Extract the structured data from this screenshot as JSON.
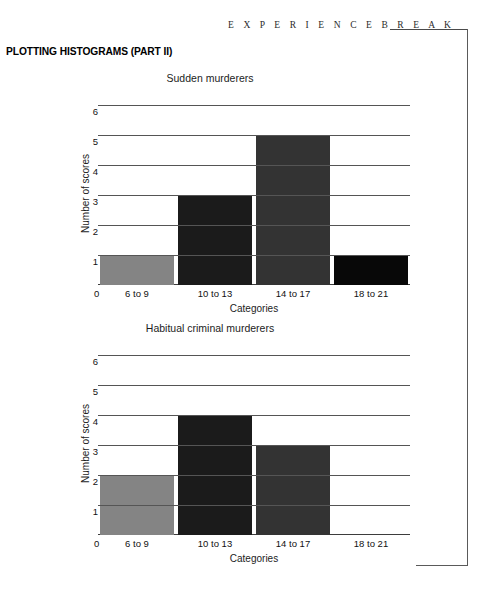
{
  "header": {
    "break_label": "E X P E R I E N C E   B R E A K",
    "section_heading": "PLOTTING HISTOGRAMS (PART II)"
  },
  "colors": {
    "bar_category_1": "#848484",
    "bar_category_2": "#1b1b1b",
    "bar_category_3": "#333333",
    "bar_category_4": "#080808",
    "gridline": "#555555",
    "axis": "#3d3d3d",
    "frame_rule": "#5a5a5a"
  },
  "charts": [
    {
      "id": "chart-1",
      "chart_data": {
        "type": "bar",
        "title": "Sudden murderers",
        "xlabel": "Categories",
        "ylabel": "Number of scores",
        "categories": [
          "6 to 9",
          "10 to 13",
          "14 to 17",
          "18 to 21"
        ],
        "values": [
          1,
          3,
          5,
          1
        ],
        "origin_label": "0",
        "ytick_labels": [
          "1",
          "2",
          "3",
          "4",
          "5",
          "6"
        ],
        "ylim": [
          0,
          6
        ],
        "grid": true,
        "legend": "none",
        "bar_colors": [
          "#848484",
          "#1b1b1b",
          "#333333",
          "#080808"
        ]
      }
    },
    {
      "id": "chart-2",
      "chart_data": {
        "type": "bar",
        "title": "Habitual criminal murderers",
        "xlabel": "Categories",
        "ylabel": "Number of scores",
        "categories": [
          "6 to 9",
          "10 to 13",
          "14 to 17",
          "18 to 21"
        ],
        "values": [
          2,
          4,
          3,
          0
        ],
        "origin_label": "0",
        "ytick_labels": [
          "1",
          "2",
          "3",
          "4",
          "5",
          "6"
        ],
        "ylim": [
          0,
          6
        ],
        "grid": true,
        "legend": "none",
        "bar_colors": [
          "#848484",
          "#1b1b1b",
          "#333333",
          "#080808"
        ]
      }
    }
  ]
}
